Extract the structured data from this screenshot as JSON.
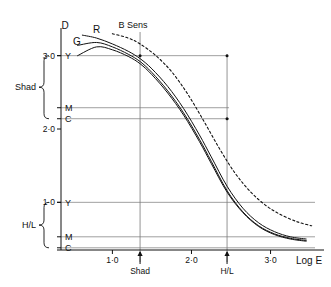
{
  "figure": {
    "kind": "sensitometric-characteristic-curve",
    "background_color": "#ffffff",
    "ink_color": "#111111",
    "construction_line_color": "#777777"
  },
  "axes": {
    "y_axis_title": "D",
    "x_axis_title": "Log E",
    "y_ticks": [
      {
        "label": "1·0",
        "value": 1.0
      },
      {
        "label": "2·0",
        "value": 2.0
      },
      {
        "label": "3·0",
        "value": 3.0
      }
    ],
    "x_ticks": [
      {
        "label": "1·0",
        "value": 1.0
      },
      {
        "label": "2·0",
        "value": 2.0
      },
      {
        "label": "3·0",
        "value": 3.0
      }
    ],
    "xlim": [
      0.35,
      3.6
    ],
    "ylim": [
      0.35,
      3.35
    ],
    "grid": false
  },
  "curve_labels": {
    "r": "R",
    "g": "G",
    "b_sens": "B Sens"
  },
  "density_markers": {
    "shadow_group": {
      "bracket_label": "Shad",
      "entries": [
        {
          "label": "Y",
          "density": 3.0
        },
        {
          "label": "M",
          "density": 2.29
        },
        {
          "label": "C",
          "density": 2.14
        }
      ]
    },
    "highlight_group": {
      "bracket_label": "H/L",
      "entries": [
        {
          "label": "Y",
          "density": 1.0
        },
        {
          "label": "M",
          "density": 0.53
        },
        {
          "label": "C",
          "density": 0.38
        }
      ]
    }
  },
  "exposure_markers": [
    {
      "label": "Shad",
      "log_e": 1.35
    },
    {
      "label": "H/L",
      "log_e": 2.45
    }
  ],
  "chart_data": {
    "type": "line",
    "title": "",
    "subtitle": "",
    "xlabel": "Log E",
    "ylabel": "D",
    "xlim": [
      0.35,
      3.6
    ],
    "ylim": [
      0.35,
      3.35
    ],
    "grid": false,
    "legend": "inline-curve-labels",
    "xticks": [
      1.0,
      2.0,
      3.0
    ],
    "xticklabels": [
      "1·0",
      "2·0",
      "3·0"
    ],
    "yticks": [
      1.0,
      2.0,
      3.0
    ],
    "yticklabels": [
      "1·0",
      "2·0",
      "3·0"
    ],
    "series": [
      {
        "name": "R",
        "style": "solid",
        "color": "#111111",
        "label_position": {
          "log_e": 0.85,
          "density": 3.3
        },
        "x": [
          0.62,
          0.8,
          1.0,
          1.2,
          1.35,
          1.5,
          1.7,
          1.9,
          2.1,
          2.25,
          2.45,
          2.65,
          2.85,
          3.05,
          3.25,
          3.45
        ],
        "y": [
          3.28,
          3.24,
          3.16,
          3.06,
          2.96,
          2.82,
          2.58,
          2.28,
          1.92,
          1.62,
          1.22,
          0.92,
          0.72,
          0.6,
          0.53,
          0.5
        ]
      },
      {
        "name": "G",
        "style": "solid",
        "color": "#111111",
        "label_position": {
          "log_e": 0.6,
          "density": 3.14
        },
        "x": [
          0.56,
          0.8,
          1.0,
          1.2,
          1.35,
          1.5,
          1.7,
          1.9,
          2.1,
          2.25,
          2.45,
          2.65,
          2.85,
          3.05,
          3.25,
          3.45
        ],
        "y": [
          3.14,
          3.18,
          3.12,
          3.02,
          2.92,
          2.77,
          2.52,
          2.22,
          1.86,
          1.56,
          1.16,
          0.87,
          0.68,
          0.57,
          0.51,
          0.48
        ]
      },
      {
        "name": "Y",
        "style": "solid",
        "color": "#111111",
        "label_position": {
          "log_e": 0.47,
          "density": 3.0
        },
        "x": [
          0.56,
          0.8,
          1.0,
          1.2,
          1.35,
          1.5,
          1.7,
          1.9,
          2.1,
          2.25,
          2.45,
          2.65,
          2.85,
          3.05,
          3.25,
          3.45
        ],
        "y": [
          3.0,
          3.12,
          3.08,
          2.99,
          2.89,
          2.74,
          2.49,
          2.19,
          1.83,
          1.53,
          1.14,
          0.86,
          0.67,
          0.56,
          0.5,
          0.47
        ]
      },
      {
        "name": "B Sens",
        "style": "dashed",
        "color": "#111111",
        "label_position": {
          "log_e": 1.45,
          "density": 3.35
        },
        "x": [
          1.0,
          1.2,
          1.35,
          1.55,
          1.75,
          1.95,
          2.15,
          2.35,
          2.55,
          2.75,
          2.95,
          3.15,
          3.35,
          3.52
        ],
        "y": [
          3.3,
          3.24,
          3.16,
          3.0,
          2.78,
          2.48,
          2.12,
          1.74,
          1.4,
          1.14,
          0.95,
          0.82,
          0.73,
          0.68
        ]
      }
    ],
    "annotations": [
      {
        "text": "Shad",
        "type": "bracket",
        "axis": "y",
        "from_density": 3.0,
        "to_density": 2.14
      },
      {
        "text": "H/L",
        "type": "bracket",
        "axis": "y",
        "from_density": 1.0,
        "to_density": 0.38
      },
      {
        "text": "Shad",
        "type": "vline-arrow",
        "axis": "x",
        "log_e": 1.35
      },
      {
        "text": "H/L",
        "type": "vline-arrow",
        "axis": "x",
        "log_e": 2.45
      },
      {
        "text": "Y",
        "type": "hline",
        "axis": "y",
        "density": 3.0
      },
      {
        "text": "M",
        "type": "hline",
        "axis": "y",
        "density": 2.29
      },
      {
        "text": "C",
        "type": "hline",
        "axis": "y",
        "density": 2.14
      },
      {
        "text": "Y",
        "type": "hline",
        "axis": "y",
        "density": 1.0
      },
      {
        "text": "M",
        "type": "hline",
        "axis": "y",
        "density": 0.53
      },
      {
        "text": "C",
        "type": "hline",
        "axis": "y",
        "density": 0.38
      }
    ]
  }
}
